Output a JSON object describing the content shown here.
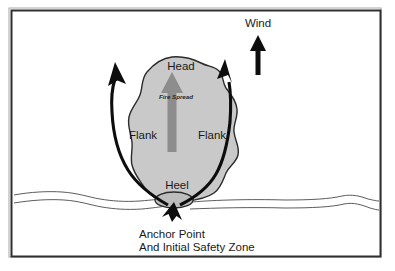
{
  "diagram": {
    "frame": {
      "border_color": "#2f2f2f",
      "background_color": "#ffffff"
    },
    "fire": {
      "fill_color": "#c9c9c9",
      "outline_color": "#2b2b2b",
      "spread_arrow_color": "#8d8d8d"
    },
    "labels": {
      "wind": "Wind",
      "head": "Head",
      "fire_spread": "Fire Spread",
      "flank_left": "Flank",
      "flank_right": "Flank",
      "heel": "Heel",
      "anchor_line1": "Anchor Point",
      "anchor_line2": "And Initial Safety Zone"
    },
    "icons": {
      "wind_arrow": "up-arrow-icon",
      "spread_arrow": "up-arrow-icon",
      "left_flank_arrow": "curved-up-arrow-icon",
      "right_flank_arrow": "curved-up-arrow-icon",
      "anchor_arrow": "up-arrow-icon",
      "terrain": "wavy-line-icon"
    }
  }
}
